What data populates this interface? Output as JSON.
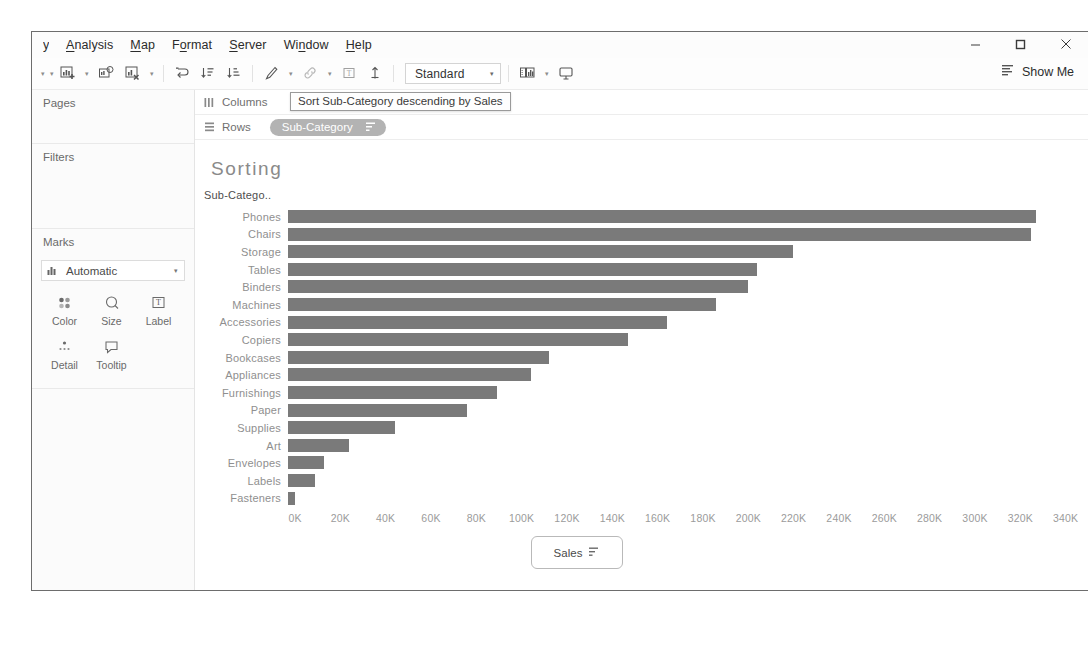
{
  "window": {
    "menu_clipped": "y",
    "menu_items": [
      {
        "label": "Analysis",
        "accel": "A"
      },
      {
        "label": "Map",
        "accel": "M"
      },
      {
        "label": "Format",
        "accel": "o"
      },
      {
        "label": "Server",
        "accel": "S"
      },
      {
        "label": "Window",
        "accel": "n"
      },
      {
        "label": "Help",
        "accel": "H"
      }
    ],
    "controls": {
      "minimize": "minimize-button",
      "maximize": "maximize-button",
      "close": "close-button"
    }
  },
  "toolbar": {
    "fit_value": "Standard",
    "show_me": "Show Me",
    "icons": [
      "new-worksheet-icon",
      "duplicate-sheet-icon",
      "clear-sheet-icon",
      "swap-rows-columns-icon",
      "sort-ascending-icon",
      "sort-descending-icon",
      "highlight-icon",
      "group-icon",
      "show-labels-icon",
      "fix-axes-icon",
      "presentation-mode-icon"
    ]
  },
  "sidebar": {
    "pages_label": "Pages",
    "filters_label": "Filters",
    "marks_label": "Marks",
    "marks_type": "Automatic",
    "marks_buttons": [
      {
        "label": "Color",
        "icon": "color-icon"
      },
      {
        "label": "Size",
        "icon": "size-icon"
      },
      {
        "label": "Label",
        "icon": "label-icon"
      },
      {
        "label": "Detail",
        "icon": "detail-icon"
      },
      {
        "label": "Tooltip",
        "icon": "tooltip-icon"
      }
    ]
  },
  "shelves": {
    "columns_label": "Columns",
    "rows_label": "Rows",
    "rows_pill": "Sub-Category",
    "tooltip": "Sort Sub-Category descending by Sales"
  },
  "sheet": {
    "title": "Sorting",
    "axis_pill_label": "Sales"
  },
  "chart_data": {
    "type": "bar",
    "orientation": "horizontal",
    "title": "Sorting",
    "xlabel": "Sales",
    "ylabel": "Sub-Catego..",
    "xlim": [
      0,
      345
    ],
    "xticks": [
      0,
      20,
      40,
      60,
      80,
      100,
      120,
      140,
      160,
      180,
      200,
      220,
      240,
      260,
      280,
      300,
      320,
      340
    ],
    "xtick_labels": [
      "0K",
      "20K",
      "40K",
      "60K",
      "80K",
      "100K",
      "120K",
      "140K",
      "160K",
      "180K",
      "200K",
      "220K",
      "240K",
      "260K",
      "280K",
      "300K",
      "320K",
      "340K"
    ],
    "grid": false,
    "legend": "none",
    "sorted": "descending by Sales",
    "bar_color": "#7a7a7a",
    "units": "thousands",
    "categories": [
      "Phones",
      "Chairs",
      "Storage",
      "Tables",
      "Binders",
      "Machines",
      "Accessories",
      "Copiers",
      "Bookcases",
      "Appliances",
      "Furnishings",
      "Paper",
      "Supplies",
      "Art",
      "Envelopes",
      "Labels",
      "Fasteners"
    ],
    "values": [
      330,
      328,
      223,
      207,
      203,
      189,
      167,
      150,
      115,
      107,
      92,
      79,
      47,
      27,
      16,
      12,
      3
    ]
  }
}
